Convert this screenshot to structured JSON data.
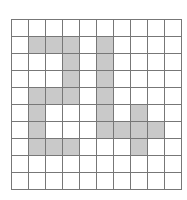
{
  "grid": {
    "rows": 10,
    "cols": 10,
    "fill_color": "#c9c9c9",
    "empty_color": "#ffffff",
    "line_color": "#777777",
    "shaded": [
      [
        0,
        0,
        0,
        0,
        0,
        0,
        0,
        0,
        0,
        0
      ],
      [
        0,
        1,
        1,
        1,
        0,
        1,
        0,
        0,
        0,
        0
      ],
      [
        0,
        0,
        0,
        1,
        0,
        1,
        0,
        0,
        0,
        0
      ],
      [
        0,
        0,
        0,
        1,
        0,
        1,
        0,
        0,
        0,
        0
      ],
      [
        0,
        1,
        1,
        1,
        0,
        1,
        0,
        0,
        0,
        0
      ],
      [
        0,
        1,
        0,
        0,
        0,
        1,
        0,
        1,
        0,
        0
      ],
      [
        0,
        1,
        0,
        0,
        0,
        1,
        1,
        1,
        1,
        0
      ],
      [
        0,
        1,
        1,
        1,
        0,
        0,
        0,
        1,
        0,
        0
      ],
      [
        0,
        0,
        0,
        0,
        0,
        0,
        0,
        0,
        0,
        0
      ],
      [
        0,
        0,
        0,
        0,
        0,
        0,
        0,
        0,
        0,
        0
      ]
    ]
  }
}
